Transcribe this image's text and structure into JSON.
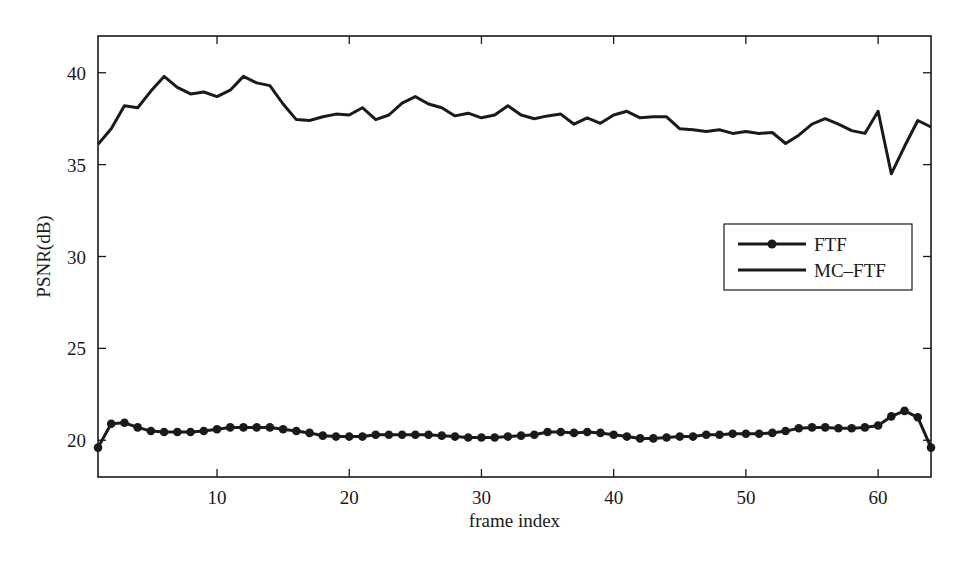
{
  "chart_data": {
    "type": "line",
    "title": "",
    "xlabel": "frame index",
    "ylabel": "PSNR(dB)",
    "xlim": [
      1,
      64
    ],
    "ylim": [
      18,
      42
    ],
    "xticks": [
      10,
      20,
      30,
      40,
      50,
      60
    ],
    "yticks": [
      20,
      25,
      30,
      35,
      40
    ],
    "grid": false,
    "legend_position": "right-middle",
    "x": [
      1,
      2,
      3,
      4,
      5,
      6,
      7,
      8,
      9,
      10,
      11,
      12,
      13,
      14,
      15,
      16,
      17,
      18,
      19,
      20,
      21,
      22,
      23,
      24,
      25,
      26,
      27,
      28,
      29,
      30,
      31,
      32,
      33,
      34,
      35,
      36,
      37,
      38,
      39,
      40,
      41,
      42,
      43,
      44,
      45,
      46,
      47,
      48,
      49,
      50,
      51,
      52,
      53,
      54,
      55,
      56,
      57,
      58,
      59,
      60,
      61,
      62,
      63,
      64
    ],
    "series": [
      {
        "name": "FTF",
        "marker": "circle",
        "color": "#1a1a1a",
        "values": [
          19.6,
          20.9,
          20.95,
          20.7,
          20.5,
          20.45,
          20.45,
          20.45,
          20.5,
          20.6,
          20.7,
          20.7,
          20.7,
          20.7,
          20.6,
          20.5,
          20.4,
          20.25,
          20.2,
          20.2,
          20.2,
          20.3,
          20.3,
          20.3,
          20.3,
          20.3,
          20.25,
          20.2,
          20.15,
          20.15,
          20.15,
          20.2,
          20.25,
          20.3,
          20.45,
          20.45,
          20.4,
          20.45,
          20.4,
          20.3,
          20.2,
          20.1,
          20.1,
          20.15,
          20.2,
          20.2,
          20.3,
          20.3,
          20.35,
          20.35,
          20.35,
          20.4,
          20.5,
          20.65,
          20.7,
          20.7,
          20.65,
          20.65,
          20.7,
          20.8,
          21.3,
          21.6,
          21.25,
          19.6
        ]
      },
      {
        "name": "MC–FTF",
        "marker": "none",
        "color": "#1a1a1a",
        "values": [
          36.1,
          36.95,
          38.2,
          38.1,
          39.0,
          39.8,
          39.2,
          38.85,
          38.95,
          38.7,
          39.05,
          39.8,
          39.45,
          39.3,
          38.3,
          37.45,
          37.4,
          37.6,
          37.75,
          37.7,
          38.1,
          37.45,
          37.7,
          38.35,
          38.7,
          38.3,
          38.1,
          37.65,
          37.8,
          37.55,
          37.7,
          38.2,
          37.7,
          37.5,
          37.65,
          37.75,
          37.2,
          37.55,
          37.25,
          37.7,
          37.9,
          37.55,
          37.6,
          37.6,
          36.95,
          36.9,
          36.8,
          36.9,
          36.7,
          36.8,
          36.7,
          36.75,
          36.15,
          36.6,
          37.2,
          37.5,
          37.2,
          36.85,
          36.7,
          37.9,
          34.5,
          36.0,
          37.4,
          37.05
        ]
      }
    ]
  },
  "legend": {
    "items": [
      {
        "label": "FTF",
        "marker": "circle"
      },
      {
        "label": "MC–FTF",
        "marker": "none"
      }
    ]
  },
  "layout": {
    "plot": {
      "left": 98,
      "top": 36,
      "right": 931,
      "bottom": 477
    },
    "legend_box": {
      "left": 724,
      "top": 224,
      "right": 912,
      "bottom": 290
    }
  }
}
